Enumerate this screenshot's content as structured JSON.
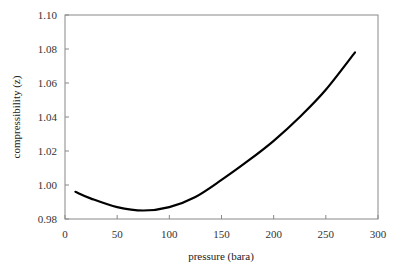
{
  "chart_data": {
    "type": "line",
    "title": "",
    "xlabel": "pressure (bara)",
    "ylabel": "compressibility (z)",
    "xlim": [
      0,
      300
    ],
    "ylim": [
      0.98,
      1.1
    ],
    "xticks": [
      0,
      50,
      100,
      150,
      200,
      250,
      300
    ],
    "yticks": [
      0.98,
      1.0,
      1.02,
      1.04,
      1.06,
      1.08,
      1.1
    ],
    "xtick_labels": [
      "0",
      "50",
      "100",
      "150",
      "200",
      "250",
      "300"
    ],
    "ytick_labels": [
      "0.98",
      "1.00",
      "1.02",
      "1.04",
      "1.06",
      "1.08",
      "1.10"
    ],
    "grid": false,
    "legend": null,
    "series": [
      {
        "name": "z-factor",
        "color": "#000000",
        "x": [
          10,
          25,
          50,
          75,
          100,
          125,
          150,
          175,
          200,
          225,
          250,
          278
        ],
        "y": [
          0.996,
          0.992,
          0.987,
          0.985,
          0.987,
          0.993,
          1.003,
          1.014,
          1.026,
          1.04,
          1.056,
          1.078
        ]
      }
    ]
  }
}
